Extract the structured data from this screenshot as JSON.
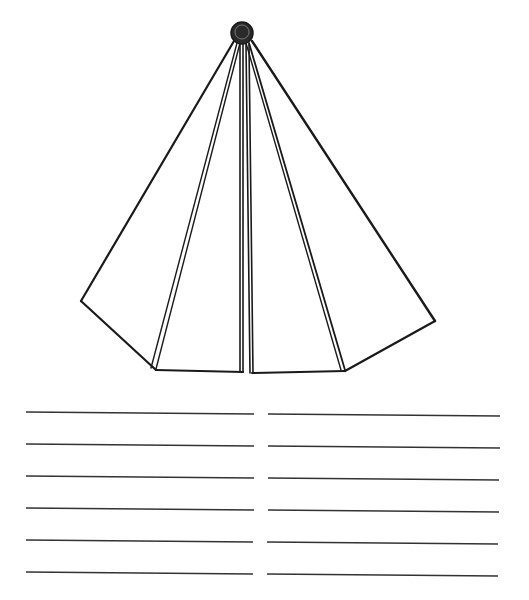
{
  "worksheet": {
    "figure": {
      "name": "pyramid-cone-figure",
      "stroke_color": "#1a1a1a",
      "apex": {
        "cx": 242,
        "cy": 33,
        "r": 11
      },
      "edges": [
        {
          "name": "left-outer-edge",
          "x1": 234,
          "y1": 41,
          "x2": 81,
          "y2": 301,
          "w": 2.2
        },
        {
          "name": "left-base-slant",
          "x1": 81,
          "y1": 301,
          "x2": 156,
          "y2": 370,
          "w": 2.2
        },
        {
          "name": "left-inner-edge-a",
          "x1": 237,
          "y1": 43,
          "x2": 151,
          "y2": 368,
          "w": 1.4
        },
        {
          "name": "left-inner-edge-b",
          "x1": 240,
          "y1": 43,
          "x2": 156,
          "y2": 369,
          "w": 1.4
        },
        {
          "name": "left-base",
          "x1": 156,
          "y1": 370,
          "x2": 243,
          "y2": 372,
          "w": 2
        },
        {
          "name": "center-left-a",
          "x1": 240,
          "y1": 44,
          "x2": 240,
          "y2": 372,
          "w": 1.6
        },
        {
          "name": "center-left-b",
          "x1": 243,
          "y1": 44,
          "x2": 243,
          "y2": 372,
          "w": 1.6
        },
        {
          "name": "center-right-a",
          "x1": 246,
          "y1": 44,
          "x2": 250,
          "y2": 373,
          "w": 1.6
        },
        {
          "name": "center-right-b",
          "x1": 249,
          "y1": 44,
          "x2": 253,
          "y2": 373,
          "w": 1.6
        },
        {
          "name": "right-base",
          "x1": 252,
          "y1": 373,
          "x2": 345,
          "y2": 371,
          "w": 2
        },
        {
          "name": "right-inner-edge-a",
          "x1": 246,
          "y1": 43,
          "x2": 341,
          "y2": 370,
          "w": 1.4
        },
        {
          "name": "right-inner-edge-b",
          "x1": 249,
          "y1": 43,
          "x2": 345,
          "y2": 370,
          "w": 1.8
        },
        {
          "name": "right-outer-edge",
          "x1": 252,
          "y1": 41,
          "x2": 435,
          "y2": 321,
          "w": 2.4
        },
        {
          "name": "right-base-slant",
          "x1": 435,
          "y1": 321,
          "x2": 345,
          "y2": 371,
          "w": 2.2
        }
      ]
    },
    "writing_lines": {
      "stroke_color": "#333333",
      "left_column": [
        {
          "x1": 26,
          "y1": 412,
          "x2": 254,
          "y2": 414
        },
        {
          "x1": 26,
          "y1": 444,
          "x2": 254,
          "y2": 446
        },
        {
          "x1": 26,
          "y1": 476,
          "x2": 254,
          "y2": 478
        },
        {
          "x1": 26,
          "y1": 508,
          "x2": 254,
          "y2": 510
        },
        {
          "x1": 26,
          "y1": 540,
          "x2": 253,
          "y2": 542
        },
        {
          "x1": 26,
          "y1": 572,
          "x2": 253,
          "y2": 574
        }
      ],
      "right_column": [
        {
          "x1": 268,
          "y1": 414,
          "x2": 500,
          "y2": 416
        },
        {
          "x1": 268,
          "y1": 446,
          "x2": 500,
          "y2": 448
        },
        {
          "x1": 268,
          "y1": 478,
          "x2": 499,
          "y2": 480
        },
        {
          "x1": 268,
          "y1": 510,
          "x2": 499,
          "y2": 512
        },
        {
          "x1": 267,
          "y1": 542,
          "x2": 498,
          "y2": 544
        },
        {
          "x1": 267,
          "y1": 574,
          "x2": 498,
          "y2": 576
        }
      ]
    }
  }
}
